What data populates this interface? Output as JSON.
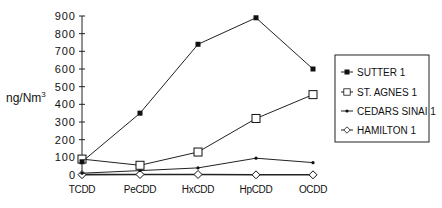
{
  "chart_data": {
    "type": "line",
    "title": "",
    "xlabel": "",
    "ylabel": "ng/Nm",
    "ylabel_superscript": "3",
    "ylim": [
      0,
      900
    ],
    "yticks": [
      0,
      100,
      200,
      300,
      400,
      500,
      600,
      700,
      800,
      900
    ],
    "grid": false,
    "legend_position": "right",
    "categories": [
      "TCDD",
      "PeCDD",
      "HxCDD",
      "HpCDD",
      "OCDD"
    ],
    "series": [
      {
        "name": "SUTTER 1",
        "marker": "filled-square",
        "values": [
          75,
          350,
          740,
          890,
          600
        ]
      },
      {
        "name": "ST. AGNES 1",
        "marker": "open-square",
        "values": [
          90,
          55,
          130,
          320,
          455
        ]
      },
      {
        "name": "CEDARS SINAI 1",
        "marker": "small-dot",
        "values": [
          10,
          25,
          40,
          95,
          70
        ]
      },
      {
        "name": "HAMILTON 1",
        "marker": "open-diamond",
        "values": [
          2,
          3,
          3,
          1,
          1
        ]
      }
    ]
  }
}
